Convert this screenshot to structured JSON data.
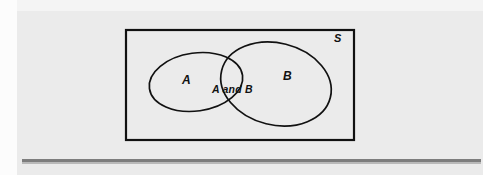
{
  "figure": {
    "type": "venn-diagram",
    "canvas": {
      "width": 483,
      "height": 175
    },
    "background_color": "#ebebeb",
    "stroke_color": "#111111",
    "rule_color": "#7d7d7d"
  },
  "universal_set": {
    "label": "S",
    "shape": "rectangle",
    "x": 126,
    "y": 30,
    "width": 228,
    "height": 110,
    "label_position": "top-right-inside"
  },
  "sets": [
    {
      "id": "A",
      "label": "A",
      "shape": "ellipse",
      "cx": 196,
      "cy": 82,
      "rx": 47,
      "ry": 29,
      "rotation": -8,
      "label_x": 187,
      "label_y": 80
    },
    {
      "id": "B",
      "label": "B",
      "shape": "ellipse",
      "cx": 276,
      "cy": 84,
      "rx": 56,
      "ry": 41,
      "rotation": 14,
      "label_x": 288,
      "label_y": 76
    }
  ],
  "intersection": {
    "label": "A and B",
    "label_x": 233,
    "label_y": 90
  },
  "rule": {
    "label": "horizontal-divider",
    "x": 22,
    "y": 159,
    "width": 459,
    "thickness": 3
  }
}
